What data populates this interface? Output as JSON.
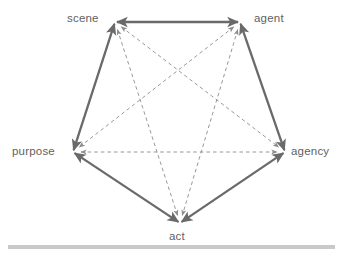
{
  "diagram": {
    "type": "pentagon-network",
    "background_color": "#ffffff",
    "solid_edge_color": "#6a6a6a",
    "dashed_edge_color": "#8c8c8c",
    "label_color": "#5f5f5f",
    "baseline_bar_color": "#c9c9c9",
    "nodes": [
      {
        "id": "scene",
        "label": "scene",
        "x": 115,
        "y": 22
      },
      {
        "id": "agent",
        "label": "agent",
        "x": 240,
        "y": 22
      },
      {
        "id": "agency",
        "label": "agency",
        "x": 285,
        "y": 152
      },
      {
        "id": "act",
        "label": "act",
        "x": 180,
        "y": 223
      },
      {
        "id": "purpose",
        "label": "purpose",
        "x": 73,
        "y": 152
      }
    ],
    "solid_edges": [
      {
        "from": "scene",
        "to": "agent",
        "style": "solid",
        "arrows": "both"
      },
      {
        "from": "agent",
        "to": "agency",
        "style": "solid",
        "arrows": "both"
      },
      {
        "from": "agency",
        "to": "act",
        "style": "solid",
        "arrows": "both"
      },
      {
        "from": "act",
        "to": "purpose",
        "style": "solid",
        "arrows": "both"
      },
      {
        "from": "purpose",
        "to": "scene",
        "style": "solid",
        "arrows": "both"
      }
    ],
    "dashed_edges": [
      {
        "from": "scene",
        "to": "agency",
        "style": "dashed",
        "arrows": "both"
      },
      {
        "from": "scene",
        "to": "act",
        "style": "dashed",
        "arrows": "both"
      },
      {
        "from": "agent",
        "to": "purpose",
        "style": "dashed",
        "arrows": "both"
      },
      {
        "from": "agent",
        "to": "act",
        "style": "dashed",
        "arrows": "both"
      },
      {
        "from": "purpose",
        "to": "agency",
        "style": "dashed",
        "arrows": "both"
      }
    ],
    "baseline_bar": {
      "x1": 8,
      "x2": 335,
      "y": 247,
      "thickness": 4
    }
  }
}
